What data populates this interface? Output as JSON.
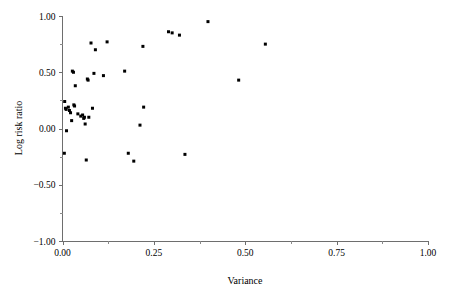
{
  "chart_data": {
    "type": "scatter",
    "title": "",
    "xlabel": "Variance",
    "ylabel": "Log risk ratio",
    "xlim": [
      0.0,
      1.0
    ],
    "ylim": [
      -1.0,
      1.0
    ],
    "grid": false,
    "legend": null,
    "x_ticks": [
      0.0,
      0.25,
      0.5,
      0.75,
      1.0
    ],
    "x_tick_labels": [
      "0.00",
      "0.25",
      "0.50",
      "0.75",
      "1.00"
    ],
    "x_minor_ticks": [
      0.125,
      0.375,
      0.625,
      0.875
    ],
    "y_ticks": [
      -1.0,
      -0.5,
      0.0,
      0.5,
      1.0
    ],
    "y_tick_labels": [
      "−1.00",
      "−0.50",
      "0.00",
      "0.50",
      "1.00"
    ],
    "y_minor_ticks": [
      -0.75,
      -0.25,
      0.25,
      0.75
    ],
    "marker": "square",
    "marker_size": 3,
    "marker_color": "#000000",
    "points": [
      {
        "x": 0.005,
        "y": -0.22
      },
      {
        "x": 0.006,
        "y": 0.24
      },
      {
        "x": 0.008,
        "y": 0.18
      },
      {
        "x": 0.01,
        "y": 0.17
      },
      {
        "x": 0.011,
        "y": -0.02
      },
      {
        "x": 0.016,
        "y": 0.19
      },
      {
        "x": 0.019,
        "y": 0.16
      },
      {
        "x": 0.022,
        "y": 0.14
      },
      {
        "x": 0.025,
        "y": 0.07
      },
      {
        "x": 0.027,
        "y": 0.51
      },
      {
        "x": 0.03,
        "y": 0.5
      },
      {
        "x": 0.031,
        "y": 0.21
      },
      {
        "x": 0.033,
        "y": 0.2
      },
      {
        "x": 0.035,
        "y": 0.38
      },
      {
        "x": 0.042,
        "y": 0.13
      },
      {
        "x": 0.05,
        "y": 0.11
      },
      {
        "x": 0.055,
        "y": 0.12
      },
      {
        "x": 0.058,
        "y": 0.09
      },
      {
        "x": 0.06,
        "y": 0.1
      },
      {
        "x": 0.062,
        "y": 0.04
      },
      {
        "x": 0.065,
        "y": -0.28
      },
      {
        "x": 0.068,
        "y": 0.44
      },
      {
        "x": 0.07,
        "y": 0.43
      },
      {
        "x": 0.072,
        "y": 0.1
      },
      {
        "x": 0.078,
        "y": 0.76
      },
      {
        "x": 0.082,
        "y": 0.18
      },
      {
        "x": 0.086,
        "y": 0.49
      },
      {
        "x": 0.09,
        "y": 0.7
      },
      {
        "x": 0.112,
        "y": 0.47
      },
      {
        "x": 0.122,
        "y": 0.77
      },
      {
        "x": 0.17,
        "y": 0.51
      },
      {
        "x": 0.18,
        "y": -0.22
      },
      {
        "x": 0.195,
        "y": -0.29
      },
      {
        "x": 0.212,
        "y": 0.03
      },
      {
        "x": 0.22,
        "y": 0.73
      },
      {
        "x": 0.222,
        "y": 0.19
      },
      {
        "x": 0.29,
        "y": 0.86
      },
      {
        "x": 0.3,
        "y": 0.85
      },
      {
        "x": 0.32,
        "y": 0.83
      },
      {
        "x": 0.335,
        "y": -0.23
      },
      {
        "x": 0.398,
        "y": 0.95
      },
      {
        "x": 0.482,
        "y": 0.43
      },
      {
        "x": 0.555,
        "y": 0.75
      }
    ]
  },
  "figure": {
    "background_color": "#ffffff",
    "axis_color": "#6e6e6e",
    "text_color": "#000000"
  }
}
